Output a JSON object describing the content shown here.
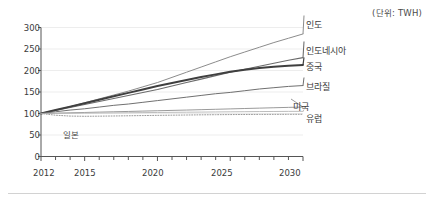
{
  "unit_note": "(단위: TWH)",
  "axis": {
    "y_ticks": [
      "0",
      "50",
      "100",
      "150",
      "200",
      "250",
      "300"
    ],
    "x_ticks": [
      "2012",
      "2015",
      "2020",
      "2025",
      "2030"
    ]
  },
  "labels": {
    "india": "인도",
    "indonesia": "인도네시아",
    "china": "중국",
    "brazil": "브라질",
    "usa": "미국",
    "europe": "유럽",
    "japan": "일본"
  },
  "chart_data": {
    "type": "line",
    "title": "",
    "subtitle": "",
    "xlabel": "",
    "ylabel": "",
    "unit": "TWH",
    "unit_note": "(단위: TWH)",
    "xlim": [
      2012,
      2030
    ],
    "ylim": [
      0,
      300
    ],
    "y_ticks": [
      0,
      50,
      100,
      150,
      200,
      250,
      300
    ],
    "x_ticks": [
      2012,
      2015,
      2020,
      2025,
      2030
    ],
    "x_minor_tick_interval": 1,
    "grid": "horizontal",
    "legend": "inline-right-of-line-ends",
    "x": [
      2012,
      2013,
      2014,
      2015,
      2016,
      2017,
      2018,
      2019,
      2020,
      2021,
      2022,
      2023,
      2024,
      2025,
      2026,
      2027,
      2028,
      2029,
      2030
    ],
    "series": [
      {
        "name": "인도",
        "name_en": "India",
        "color": "#8c8c8c",
        "style": "solid",
        "width": 1.0,
        "label_at_end": true,
        "values": [
          100,
          108,
          116,
          125,
          134,
          143,
          152,
          162,
          172,
          184,
          196,
          208,
          220,
          232,
          243,
          254,
          265,
          275,
          285
        ]
      },
      {
        "name": "인도네시아",
        "name_en": "Indonesia",
        "color": "#6b6b6b",
        "style": "solid",
        "width": 1.1,
        "label_at_end": true,
        "values": [
          100,
          107,
          114,
          121,
          128,
          135,
          142,
          149,
          156,
          164,
          172,
          180,
          188,
          196,
          203,
          210,
          217,
          224,
          230
        ]
      },
      {
        "name": "중국",
        "name_en": "China",
        "color": "#3f3f3f",
        "style": "solid",
        "width": 2.0,
        "label_at_end": true,
        "values": [
          100,
          108,
          116,
          124,
          132,
          140,
          148,
          156,
          164,
          171,
          178,
          185,
          191,
          197,
          202,
          206,
          209,
          211,
          213
        ]
      },
      {
        "name": "브라질",
        "name_en": "Brazil",
        "color": "#707070",
        "style": "solid",
        "width": 1.0,
        "label_at_end": true,
        "values": [
          100,
          104,
          108,
          111,
          115,
          119,
          122,
          126,
          130,
          134,
          138,
          142,
          146,
          149,
          153,
          157,
          160,
          163,
          165
        ]
      },
      {
        "name": "미국",
        "name_en": "United States",
        "color": "#8f8f8f",
        "style": "solid",
        "width": 0.9,
        "label_at_end": true,
        "values": [
          100,
          100.8,
          101.6,
          102.4,
          103.2,
          104,
          104.8,
          105.6,
          106.4,
          107.2,
          108,
          108.9,
          109.8,
          110.7,
          111.6,
          112.5,
          113.4,
          114.2,
          115
        ]
      },
      {
        "name": "유럽",
        "name_en": "Europe",
        "color": "#b5b5b5",
        "style": "solid",
        "width": 0.9,
        "label_at_end": true,
        "values": [
          100,
          100.3,
          100.6,
          100.9,
          101.2,
          101.5,
          101.8,
          102.1,
          102.4,
          102.7,
          103,
          103.3,
          103.6,
          103.9,
          104.2,
          104.5,
          104.7,
          104.9,
          105
        ]
      },
      {
        "name": "일본",
        "name_en": "Japan",
        "color": "#9a9a9a",
        "style": "dotted",
        "width": 1.0,
        "label_at_end": false,
        "label_position": "inside-left-below",
        "values": [
          100,
          96,
          94,
          93.5,
          93.8,
          94.2,
          94.7,
          95.2,
          95.7,
          96.1,
          96.5,
          96.9,
          97.2,
          97.5,
          97.7,
          97.9,
          98,
          98.1,
          98.2
        ]
      }
    ]
  },
  "colors": {
    "axis": "#555555",
    "grid": "#ededed",
    "text": "#3b3b3b",
    "rule": "#d2d2d2",
    "background": "#ffffff"
  }
}
